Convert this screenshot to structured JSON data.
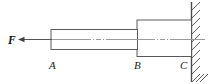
{
  "figure": {
    "type": "engineering-free-body-diagram",
    "background_color": "#ffffff",
    "outline_color": "#5a5a5a",
    "centerline_color": "#9a9a9a",
    "wall_color": "#4a4a4a"
  },
  "force": {
    "label": "F",
    "direction": "left",
    "arrow_icon": "arrow-left-icon"
  },
  "labels": {
    "a": "A",
    "b": "B",
    "c": "C"
  },
  "geometry": {
    "thin_segment": {
      "name": "segment-AB",
      "x_start": 51,
      "x_end": 137,
      "y_top": 29.5,
      "y_bottom": 49.5
    },
    "thick_segment": {
      "name": "segment-BC",
      "x_start": 137,
      "x_end": 191,
      "y_top": 20,
      "y_bottom": 56.5
    },
    "centerline_y": 39.5,
    "wall_x": 191
  }
}
